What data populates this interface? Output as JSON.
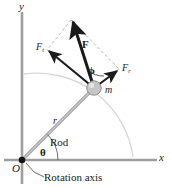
{
  "figure": {
    "width": 171,
    "height": 188,
    "background": "#ffffff",
    "colors": {
      "axis": "#9a9a9a",
      "rod": "#9a9a9a",
      "arc": "#d2d2d2",
      "dashed": "#b5b5b5",
      "vector": "#1a1a1a",
      "mass_fill": "#c6c6c6",
      "mass_stroke": "#8a8a8a",
      "text": "#1a1a1a"
    }
  },
  "axes": {
    "y_label": "y",
    "x_label": "x",
    "origin_label": "O",
    "origin": {
      "x": 22,
      "y": 160
    },
    "x_axis_end": {
      "x": 157,
      "y": 160
    },
    "y_axis_end": {
      "x": 22,
      "y": 12
    }
  },
  "geometry": {
    "mass": {
      "x": 94,
      "y": 88,
      "radius": 7
    },
    "rod_angle_deg": 42,
    "phi_angle_deg": 47,
    "force_tip": {
      "x": 71,
      "y": 20
    },
    "tangential_tip": {
      "x": 47,
      "y": 50
    },
    "radial_tip": {
      "x": 119,
      "y": 69
    },
    "arc_radius": 97
  },
  "labels": {
    "rod": "Rod",
    "radius": "r",
    "mass": "m",
    "theta": "θ",
    "phi": "ϕ",
    "force": "F",
    "force_tangential_base": "F",
    "force_tangential_sub": "t",
    "force_radial_base": "F",
    "force_radial_sub": "r",
    "rotation_axis": "Rotation axis"
  }
}
